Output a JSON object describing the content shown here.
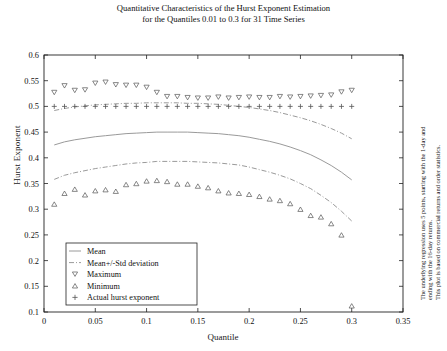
{
  "chart_data": {
    "type": "line",
    "title": "Quantitative Characteristics of the Hurst Exponent Estimation",
    "subtitle": "for the Quantiles 0.01 to 0.3 for 31 Time Series",
    "xlabel": "Quantile",
    "ylabel": "Hurst Exponent",
    "xlim": [
      0,
      0.35
    ],
    "ylim": [
      0.1,
      0.6
    ],
    "xticks": [
      0,
      0.05,
      0.1,
      0.15,
      0.2,
      0.25,
      0.3,
      0.35
    ],
    "xticklabels": [
      "0",
      "0.05",
      "0.1",
      "0.15",
      "0.2",
      "0.25",
      "0.3",
      "0.35"
    ],
    "yticks": [
      0.1,
      0.15,
      0.2,
      0.25,
      0.3,
      0.35,
      0.4,
      0.45,
      0.5,
      0.55,
      0.6
    ],
    "yticklabels": [
      "0.1",
      "0.15",
      "0.2",
      "0.25",
      "0.3",
      "0.35",
      "0.4",
      "0.45",
      "0.5",
      "0.55",
      "0.6"
    ],
    "grid": false,
    "legend_position": "lower left",
    "x": [
      0.01,
      0.02,
      0.03,
      0.04,
      0.05,
      0.06,
      0.07,
      0.08,
      0.09,
      0.1,
      0.11,
      0.12,
      0.13,
      0.14,
      0.15,
      0.16,
      0.17,
      0.18,
      0.19,
      0.2,
      0.21,
      0.22,
      0.23,
      0.24,
      0.25,
      0.26,
      0.27,
      0.28,
      0.29,
      0.3
    ],
    "series": [
      {
        "name": "Mean",
        "style": "solid-line",
        "values": [
          0.425,
          0.431,
          0.435,
          0.438,
          0.441,
          0.443,
          0.445,
          0.447,
          0.448,
          0.449,
          0.45,
          0.45,
          0.45,
          0.45,
          0.449,
          0.448,
          0.447,
          0.445,
          0.443,
          0.44,
          0.436,
          0.432,
          0.427,
          0.421,
          0.414,
          0.406,
          0.396,
          0.385,
          0.372,
          0.357
        ]
      },
      {
        "name": "Mean+/-Std deviation",
        "style": "dashdot-line-upper",
        "values": [
          0.492,
          0.496,
          0.499,
          0.501,
          0.503,
          0.504,
          0.505,
          0.506,
          0.506,
          0.507,
          0.507,
          0.507,
          0.507,
          0.506,
          0.506,
          0.505,
          0.504,
          0.502,
          0.5,
          0.498,
          0.495,
          0.492,
          0.488,
          0.483,
          0.478,
          0.472,
          0.465,
          0.457,
          0.448,
          0.437
        ]
      },
      {
        "name": "Mean+/-Std deviation",
        "style": "dashdot-line-lower",
        "values": [
          0.358,
          0.366,
          0.371,
          0.375,
          0.379,
          0.382,
          0.385,
          0.388,
          0.39,
          0.391,
          0.393,
          0.393,
          0.393,
          0.393,
          0.392,
          0.391,
          0.39,
          0.388,
          0.386,
          0.382,
          0.377,
          0.372,
          0.366,
          0.359,
          0.35,
          0.34,
          0.327,
          0.313,
          0.296,
          0.277
        ]
      },
      {
        "name": "Maximum",
        "style": "marker-down-triangle",
        "values": [
          0.527,
          0.54,
          0.531,
          0.532,
          0.545,
          0.547,
          0.542,
          0.541,
          0.541,
          0.537,
          0.527,
          0.519,
          0.519,
          0.517,
          0.516,
          0.516,
          0.518,
          0.516,
          0.517,
          0.518,
          0.517,
          0.517,
          0.519,
          0.518,
          0.519,
          0.52,
          0.521,
          0.522,
          0.528,
          0.531
        ]
      },
      {
        "name": "Minimum",
        "style": "marker-up-triangle",
        "values": [
          0.31,
          0.331,
          0.339,
          0.328,
          0.336,
          0.338,
          0.335,
          0.348,
          0.35,
          0.355,
          0.356,
          0.354,
          0.349,
          0.349,
          0.345,
          0.342,
          0.336,
          0.332,
          0.331,
          0.329,
          0.325,
          0.32,
          0.317,
          0.311,
          0.3,
          0.288,
          0.285,
          0.272,
          0.25,
          0.112
        ]
      },
      {
        "name": "Actual hurst exponent",
        "style": "marker-plus",
        "values": [
          0.5,
          0.5,
          0.5,
          0.5,
          0.5,
          0.5,
          0.5,
          0.5,
          0.5,
          0.5,
          0.5,
          0.5,
          0.5,
          0.5,
          0.5,
          0.5,
          0.5,
          0.5,
          0.5,
          0.5,
          0.5,
          0.5,
          0.5,
          0.5,
          0.5,
          0.5,
          0.5,
          0.5,
          0.5,
          0.5
        ]
      }
    ],
    "legend": [
      {
        "label": "Mean",
        "marker": "solid-line"
      },
      {
        "label": "Mean+/-Std deviation",
        "marker": "dashdot-line"
      },
      {
        "label": "Maximum",
        "marker": "down-triangle"
      },
      {
        "label": "Minimum",
        "marker": "up-triangle"
      },
      {
        "label": "Actual hurst exponent",
        "marker": "plus"
      }
    ],
    "annotations": [
      "The underlying regression uses 5 points, starting with the 1-day and",
      "ending with the 16-day returns.",
      "This plot is based on commercial returns and order statistics."
    ],
    "colors": {
      "line": "#9a9a9a",
      "marker": "#555555",
      "axis": "#222222",
      "text": "#111111",
      "background": "#ffffff"
    }
  }
}
